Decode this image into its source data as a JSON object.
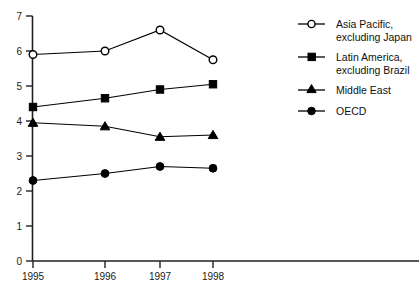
{
  "chart_data": {
    "type": "line",
    "title": "",
    "xlabel": "",
    "ylabel": "",
    "categories": [
      "1995",
      "1996",
      "1997",
      "1998"
    ],
    "x": [
      1995,
      1996,
      1997,
      1998
    ],
    "xlim": [
      1995,
      1998
    ],
    "ylim": [
      0,
      7
    ],
    "yticks": [
      0,
      1,
      2,
      3,
      4,
      5,
      6,
      7
    ],
    "ytick_labels": [
      "0",
      "1",
      "2",
      "3",
      "4",
      "5",
      "6",
      "7"
    ],
    "grid": false,
    "legend_position": "right",
    "series": [
      {
        "name": "Asia Pacific, excluding Japan",
        "marker": "open-circle",
        "values": [
          5.9,
          6.0,
          6.6,
          5.75
        ]
      },
      {
        "name": "Latin America, excluding Brazil",
        "marker": "filled-square",
        "values": [
          4.4,
          4.65,
          4.9,
          5.05
        ]
      },
      {
        "name": "Middle East",
        "marker": "filled-triangle",
        "values": [
          3.95,
          3.85,
          3.55,
          3.6
        ]
      },
      {
        "name": "OECD",
        "marker": "filled-circle",
        "values": [
          2.3,
          2.5,
          2.7,
          2.65
        ]
      }
    ]
  },
  "legend": {
    "entries": [
      {
        "line1": "Asia Pacific,",
        "line2": "excluding Japan",
        "marker": "open-circle"
      },
      {
        "line1": "Latin America,",
        "line2": "excluding Brazil",
        "marker": "filled-square"
      },
      {
        "line1": "Middle East",
        "line2": "",
        "marker": "filled-triangle"
      },
      {
        "line1": "OECD",
        "line2": "",
        "marker": "filled-circle"
      }
    ]
  },
  "axis": {
    "y_labels": [
      "7",
      "6",
      "5",
      "4",
      "3",
      "2",
      "1",
      "0"
    ],
    "x_labels": [
      "1995",
      "1996",
      "1997",
      "1998"
    ]
  },
  "colors": {
    "ink": "#000000",
    "background": "#ffffff"
  }
}
